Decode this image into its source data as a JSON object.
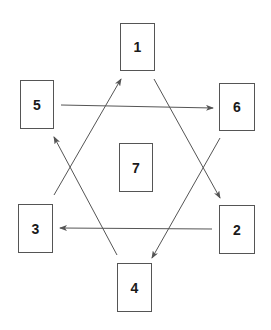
{
  "diagram": {
    "type": "directed-graph",
    "line_color": "#555555",
    "nodes": [
      {
        "id": "1",
        "label": "1",
        "x": 120,
        "y": 23,
        "w": 35,
        "h": 48
      },
      {
        "id": "2",
        "label": "2",
        "x": 219,
        "y": 205,
        "w": 36,
        "h": 49
      },
      {
        "id": "3",
        "label": "3",
        "x": 18,
        "y": 204,
        "w": 35,
        "h": 49
      },
      {
        "id": "4",
        "label": "4",
        "x": 117,
        "y": 263,
        "w": 35,
        "h": 49
      },
      {
        "id": "5",
        "label": "5",
        "x": 20,
        "y": 80,
        "w": 34,
        "h": 49
      },
      {
        "id": "6",
        "label": "6",
        "x": 219,
        "y": 83,
        "w": 36,
        "h": 48
      },
      {
        "id": "7",
        "label": "7",
        "x": 119,
        "y": 143,
        "w": 34,
        "h": 49
      }
    ],
    "edges": [
      {
        "from": "3",
        "to": "1",
        "x1": 54,
        "y1": 195,
        "x2": 121,
        "y2": 79
      },
      {
        "from": "1",
        "to": "2",
        "x1": 154,
        "y1": 79,
        "x2": 220,
        "y2": 198
      },
      {
        "from": "2",
        "to": "3",
        "x1": 212,
        "y1": 229,
        "x2": 60,
        "y2": 228
      },
      {
        "from": "4",
        "to": "5",
        "x1": 117,
        "y1": 255,
        "x2": 54,
        "y2": 137
      },
      {
        "from": "5",
        "to": "6",
        "x1": 61,
        "y1": 105,
        "x2": 213,
        "y2": 108
      },
      {
        "from": "6",
        "to": "4",
        "x1": 220,
        "y1": 138,
        "x2": 152,
        "y2": 258
      }
    ]
  }
}
